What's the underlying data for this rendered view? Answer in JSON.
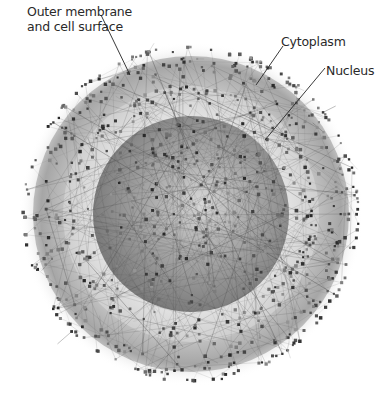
{
  "diagram": {
    "type": "cellular-protein-interaction-network",
    "center": {
      "x": 191,
      "y": 214
    },
    "compartments": [
      {
        "id": "outer-membrane",
        "name": "Outer membrane and cell surface",
        "outer_radius": 158,
        "inner_radius": 128,
        "color": "#a9a9a9"
      },
      {
        "id": "cytoplasm",
        "name": "Cytoplasm",
        "outer_radius": 128,
        "inner_radius": 98,
        "color": "#d6d6d6"
      },
      {
        "id": "nucleus",
        "name": "Nucleus",
        "outer_radius": 98,
        "color": "#8e8e8e"
      }
    ],
    "halo_radius": 172,
    "node_color": "#555555",
    "edge_color": "#4a4a4a"
  },
  "labels": {
    "outer_membrane_line1": "Outer membrane",
    "outer_membrane_line2": "and cell surface",
    "cytoplasm": "Cytoplasm",
    "nucleus": "Nucleus"
  },
  "leaders": [
    {
      "name": "outer-membrane-leader",
      "x1": 101,
      "y1": 15,
      "x2": 130,
      "y2": 75
    },
    {
      "name": "cytoplasm-leader",
      "x1": 283,
      "y1": 46,
      "x2": 256,
      "y2": 85
    },
    {
      "name": "nucleus-leader",
      "x1": 325,
      "y1": 68,
      "x2": 265,
      "y2": 140
    }
  ]
}
